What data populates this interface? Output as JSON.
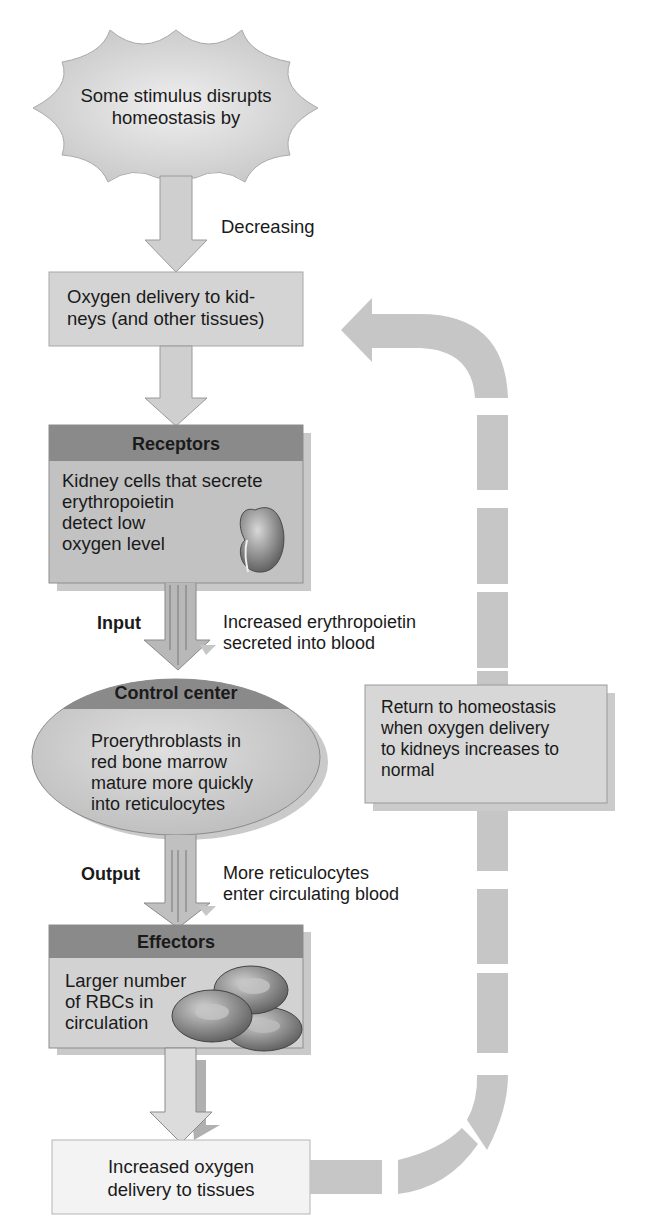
{
  "diagram": {
    "stimulus": {
      "text_line1": "Some stimulus disrupts",
      "text_line2": "homeostasis by",
      "arrow_label": "Decreasing"
    },
    "controlled_condition": {
      "line1": "Oxygen delivery to kid-",
      "line2": "neys (and other tissues)"
    },
    "receptors": {
      "header": "Receptors",
      "line1": "Kidney cells that secrete",
      "line2": "erythropoietin",
      "line3": "detect low",
      "line4": "oxygen level",
      "icon": "kidney-icon"
    },
    "input": {
      "label": "Input",
      "line1": "Increased erythropoietin",
      "line2": "secreted into blood"
    },
    "control_center": {
      "header": "Control center",
      "line1": "Proerythroblasts in",
      "line2": "red bone marrow",
      "line3": "mature more quickly",
      "line4": "into reticulocytes"
    },
    "output": {
      "label": "Output",
      "line1": "More reticulocytes",
      "line2": "enter circulating blood"
    },
    "effectors": {
      "header": "Effectors",
      "line1": "Larger number",
      "line2": "of RBCs in",
      "line3": "circulation",
      "icon": "red-blood-cells-icon"
    },
    "response": {
      "line1": "Increased oxygen",
      "line2": "delivery to tissues"
    },
    "feedback": {
      "line1": "Return to homeostasis",
      "line2": "when oxygen delivery",
      "line3": "to kidneys increases to",
      "line4": "normal"
    },
    "colors": {
      "header_gray": "#8c8c8c",
      "box_gray": "#c4c4c4",
      "light_box": "#d9d9d9",
      "response_box": "#f2f2f2",
      "arrow_gray": "#cfcfcf",
      "feedback_gray": "#c6c6c6"
    }
  }
}
